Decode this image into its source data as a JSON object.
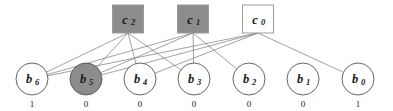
{
  "diagram": {
    "colors": {
      "check_filled": "#8c8c8c",
      "check_empty": "#ffffff",
      "check_border": "#9a9a9a",
      "var_filled": "#8c8c8c",
      "var_empty": "#ffffff",
      "var_border": "#555555",
      "edge": "#7a7a7a",
      "text": "#1a1a1a",
      "background": "#ffffff"
    },
    "check_nodes": [
      {
        "id": "c2",
        "base": "c",
        "sub": "2",
        "cx": 128,
        "cy": 19,
        "w": 31,
        "h": 28,
        "fill": "#8c8c8c"
      },
      {
        "id": "c1",
        "base": "c",
        "sub": "1",
        "cx": 193,
        "cy": 19,
        "w": 31,
        "h": 28,
        "fill": "#8c8c8c"
      },
      {
        "id": "c0",
        "base": "c",
        "sub": "0",
        "cx": 258,
        "cy": 19,
        "w": 31,
        "h": 28,
        "fill": "#ffffff"
      }
    ],
    "variable_nodes": [
      {
        "id": "b6",
        "base": "b",
        "sub": "6",
        "cx": 32,
        "cy": 79,
        "r": 16,
        "fill": "#ffffff",
        "value": "1"
      },
      {
        "id": "b5",
        "base": "b",
        "sub": "5",
        "cx": 86,
        "cy": 79,
        "r": 16,
        "fill": "#8c8c8c",
        "value": "0"
      },
      {
        "id": "b4",
        "base": "b",
        "sub": "4",
        "cx": 140,
        "cy": 79,
        "r": 16,
        "fill": "#ffffff",
        "value": "0"
      },
      {
        "id": "b3",
        "base": "b",
        "sub": "3",
        "cx": 194,
        "cy": 79,
        "r": 16,
        "fill": "#ffffff",
        "value": "0"
      },
      {
        "id": "b2",
        "base": "b",
        "sub": "2",
        "cx": 249,
        "cy": 79,
        "r": 16,
        "fill": "#ffffff",
        "value": "0"
      },
      {
        "id": "b1",
        "base": "b",
        "sub": "1",
        "cx": 303,
        "cy": 79,
        "r": 16,
        "fill": "#ffffff",
        "value": "0"
      },
      {
        "id": "b0",
        "base": "b",
        "sub": "0",
        "cx": 358,
        "cy": 79,
        "r": 16,
        "fill": "#ffffff",
        "value": "1"
      }
    ],
    "edges": [
      {
        "from": "c2",
        "to": "b6"
      },
      {
        "from": "c2",
        "to": "b5"
      },
      {
        "from": "c2",
        "to": "b4"
      },
      {
        "from": "c2",
        "to": "b3"
      },
      {
        "from": "c1",
        "to": "b6"
      },
      {
        "from": "c1",
        "to": "b5"
      },
      {
        "from": "c1",
        "to": "b3"
      },
      {
        "from": "c1",
        "to": "b2"
      },
      {
        "from": "c0",
        "to": "b6"
      },
      {
        "from": "c0",
        "to": "b5"
      },
      {
        "from": "c0",
        "to": "b4"
      },
      {
        "from": "c0",
        "to": "b0"
      }
    ],
    "bit_values_row": [
      "1",
      "0",
      "0",
      "0",
      "0",
      "0",
      "1"
    ]
  }
}
